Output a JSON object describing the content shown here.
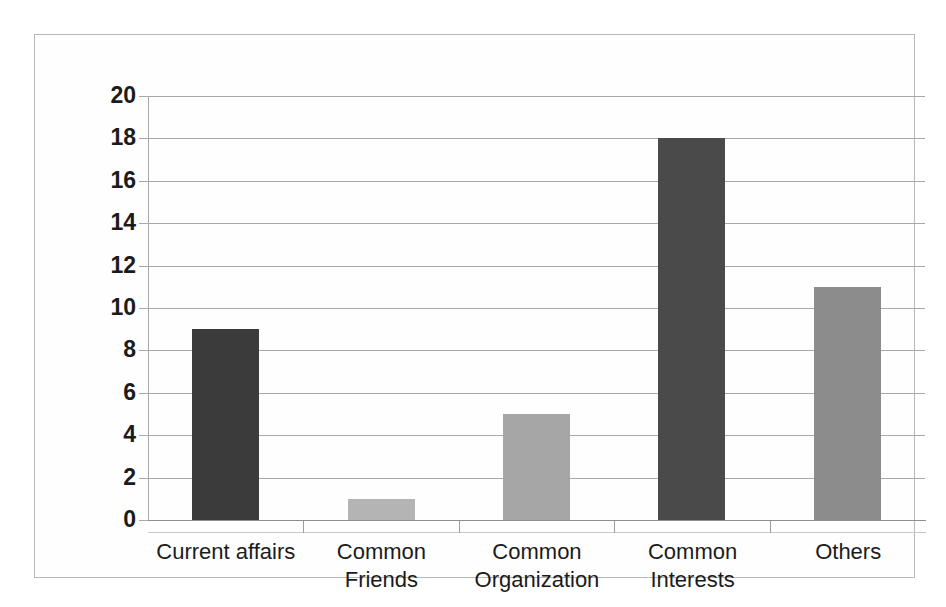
{
  "chart_data": {
    "type": "bar",
    "title": "",
    "subtitle": "",
    "xlabel": "",
    "ylabel": "",
    "categories": [
      "Current affairs",
      "Common Friends",
      "Common Organization",
      "Common Interests",
      "Others"
    ],
    "values": [
      9,
      1,
      5,
      18,
      11
    ],
    "ylim": [
      0,
      20
    ],
    "ytick_step": 2,
    "yticks": [
      20,
      18,
      16,
      14,
      12,
      10,
      8,
      6,
      4,
      2,
      0
    ],
    "grid": true,
    "legend": false,
    "legend_position": "none",
    "bar_colors": [
      "#3b3b3b",
      "#b4b4b4",
      "#a6a6a6",
      "#4a4a4a",
      "#8c8c8c"
    ],
    "series": [
      {
        "name": "Reason for connecting",
        "values": [
          9,
          1,
          5,
          18,
          11
        ]
      }
    ],
    "annotations": []
  },
  "axis": {
    "y_tick_labels": [
      "20",
      "18",
      "16",
      "14",
      "12",
      "10",
      "8",
      "6",
      "4",
      "2",
      "0"
    ],
    "x_tick_labels": [
      "Current affairs",
      "Common Friends",
      "Common Organization",
      "Common Interests",
      "Others"
    ]
  },
  "style": {
    "frame_color": "#b9b9b9",
    "grid_color": "#a8a8a8",
    "axis_color": "#8e8e8e",
    "text_color": "#1b1b1b",
    "background": "#fefefe"
  }
}
